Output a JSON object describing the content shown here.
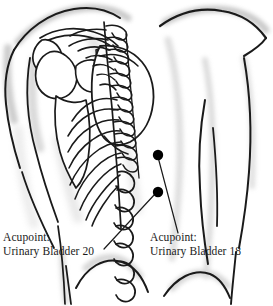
{
  "figure": {
    "type": "anatomical-illustration",
    "view": "posterior-back-torso",
    "background_color": "#ffffff",
    "ink_color": "#1a1a1a",
    "shading_color": "#b8b8b8"
  },
  "labels": [
    {
      "id": "bl20",
      "line1": "Acupoint:",
      "line2": "Urinary Bladder 20",
      "point_name": "acupoint-marker-bl20"
    },
    {
      "id": "bl18",
      "line1": "Acupoint:",
      "line2": "Urinary Bladder 18",
      "point_name": "acupoint-marker-bl18"
    }
  ],
  "acupoints": [
    {
      "id": "bl18",
      "label": "Urinary Bladder 18",
      "x": 158,
      "y": 155,
      "radius": 5,
      "color": "#000000"
    },
    {
      "id": "bl20",
      "label": "Urinary Bladder 20",
      "x": 158,
      "y": 192,
      "radius": 5,
      "color": "#000000"
    }
  ],
  "anatomy_parts": [
    "left-shoulder-outline",
    "right-shoulder-outline",
    "scapula",
    "humerus",
    "clavicle",
    "rib-cage",
    "thoracic-vertebrae",
    "lumbar-vertebrae",
    "sacrum",
    "left-arm-outline",
    "right-arm-outline",
    "torso-outline",
    "gluteal-outline"
  ]
}
